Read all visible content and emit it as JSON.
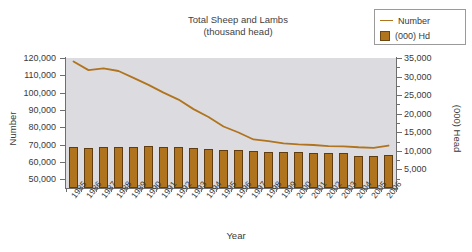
{
  "chart_data": {
    "type": "bar",
    "title": "Total Sheep and Lambs",
    "subtitle": "(thousand head)",
    "xlabel": "Year",
    "ylabel": "Number",
    "ylabel_right": "(000) Head",
    "grid": false,
    "legend_position": "top-right",
    "categories": [
      "1985",
      "1986",
      "1987",
      "1988",
      "1989",
      "1990",
      "1991",
      "1992",
      "1993",
      "1994",
      "1995",
      "1996",
      "1997",
      "1998",
      "1999",
      "2000",
      "2001",
      "2002",
      "2003",
      "2004",
      "2005",
      "2006"
    ],
    "ylim": [
      45000,
      120000
    ],
    "ylim_right": [
      0,
      35000
    ],
    "yticks": [
      "50,000",
      "60,000",
      "70,000",
      "80,000",
      "90,000",
      "100,000",
      "110,000",
      "120,000"
    ],
    "ytick_values": [
      50000,
      60000,
      70000,
      80000,
      90000,
      100000,
      110000,
      120000
    ],
    "yticks_right": [
      "5,000",
      "10,000",
      "15,000",
      "20,000",
      "25,000",
      "30,000",
      "35,000"
    ],
    "ytick_values_right": [
      5000,
      10000,
      15000,
      20000,
      25000,
      30000,
      35000
    ],
    "series": [
      {
        "name": "Number",
        "type": "line",
        "axis": "left",
        "color": "#b0741f",
        "values": [
          118000,
          113000,
          114000,
          112500,
          108500,
          104500,
          100000,
          96000,
          90500,
          86000,
          80500,
          77000,
          73000,
          72000,
          70800,
          70200,
          69800,
          69200,
          69000,
          68500,
          68200,
          69500
        ]
      },
      {
        "name": "(000) Hd",
        "type": "bar",
        "axis": "right",
        "color": "#b0741f",
        "values": [
          11000,
          10700,
          10950,
          11050,
          11000,
          11250,
          11150,
          11000,
          10750,
          10550,
          10250,
          10150,
          10050,
          9750,
          9650,
          9650,
          9500,
          9350,
          9300,
          8550,
          8700,
          8950
        ]
      }
    ]
  },
  "legend": {
    "items": [
      {
        "label": "Number",
        "marker": "line"
      },
      {
        "label": "(000) Hd",
        "marker": "square"
      }
    ]
  },
  "colors": {
    "series": "#b0741f",
    "bar_border": "#5f3d10",
    "plot_background": "#dcdce0",
    "axis": "#6e6e6e",
    "text": "#3a3a3a",
    "page_background": "#ffffff"
  }
}
